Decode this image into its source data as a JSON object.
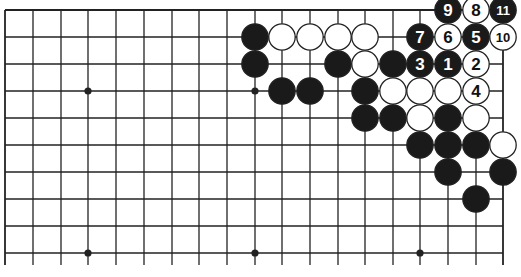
{
  "diagram": {
    "type": "go-board-partial",
    "colors": {
      "line": "#222222",
      "black_stone": "#1a1a1a",
      "white_stone": "#ffffff",
      "background": "#ffffff"
    },
    "grid": {
      "columns": 19,
      "visible_rows": 10,
      "col_x": [
        5,
        33,
        61,
        88,
        116,
        144,
        172,
        199,
        227,
        255,
        282,
        310,
        338,
        365,
        393,
        420,
        448,
        476,
        503
      ],
      "row_y": [
        10,
        37,
        64,
        91,
        118,
        145,
        172,
        199,
        226,
        253
      ],
      "bottom_extent": 265,
      "edges": [
        "top",
        "left",
        "right"
      ]
    },
    "hoshi": [
      {
        "col": 3,
        "row": 3
      },
      {
        "col": 9,
        "row": 3
      },
      {
        "col": 15,
        "row": 3
      },
      {
        "col": 3,
        "row": 9
      },
      {
        "col": 9,
        "row": 9
      },
      {
        "col": 15,
        "row": 9
      }
    ],
    "stones": [
      {
        "col": 16,
        "row": 0,
        "color": "black",
        "label": "9"
      },
      {
        "col": 17,
        "row": 0,
        "color": "white",
        "label": "8"
      },
      {
        "col": 18,
        "row": 0,
        "color": "black",
        "label": "11"
      },
      {
        "col": 9,
        "row": 1,
        "color": "black",
        "label": ""
      },
      {
        "col": 10,
        "row": 1,
        "color": "white",
        "label": ""
      },
      {
        "col": 11,
        "row": 1,
        "color": "white",
        "label": ""
      },
      {
        "col": 12,
        "row": 1,
        "color": "white",
        "label": ""
      },
      {
        "col": 13,
        "row": 1,
        "color": "white",
        "label": ""
      },
      {
        "col": 15,
        "row": 1,
        "color": "black",
        "label": "7"
      },
      {
        "col": 16,
        "row": 1,
        "color": "white",
        "label": "6"
      },
      {
        "col": 17,
        "row": 1,
        "color": "black",
        "label": "5"
      },
      {
        "col": 18,
        "row": 1,
        "color": "white",
        "label": "10"
      },
      {
        "col": 9,
        "row": 2,
        "color": "black",
        "label": ""
      },
      {
        "col": 12,
        "row": 2,
        "color": "black",
        "label": ""
      },
      {
        "col": 13,
        "row": 2,
        "color": "white",
        "label": ""
      },
      {
        "col": 14,
        "row": 2,
        "color": "black",
        "label": ""
      },
      {
        "col": 15,
        "row": 2,
        "color": "black",
        "label": "3"
      },
      {
        "col": 16,
        "row": 2,
        "color": "black",
        "label": "1"
      },
      {
        "col": 17,
        "row": 2,
        "color": "white",
        "label": "2"
      },
      {
        "col": 10,
        "row": 3,
        "color": "black",
        "label": ""
      },
      {
        "col": 11,
        "row": 3,
        "color": "black",
        "label": ""
      },
      {
        "col": 13,
        "row": 3,
        "color": "black",
        "label": ""
      },
      {
        "col": 14,
        "row": 3,
        "color": "white",
        "label": ""
      },
      {
        "col": 15,
        "row": 3,
        "color": "white",
        "label": ""
      },
      {
        "col": 16,
        "row": 3,
        "color": "white",
        "label": ""
      },
      {
        "col": 17,
        "row": 3,
        "color": "white",
        "label": "4"
      },
      {
        "col": 13,
        "row": 4,
        "color": "black",
        "label": ""
      },
      {
        "col": 14,
        "row": 4,
        "color": "black",
        "label": ""
      },
      {
        "col": 15,
        "row": 4,
        "color": "white",
        "label": ""
      },
      {
        "col": 16,
        "row": 4,
        "color": "black",
        "label": ""
      },
      {
        "col": 17,
        "row": 4,
        "color": "white",
        "label": ""
      },
      {
        "col": 15,
        "row": 5,
        "color": "black",
        "label": ""
      },
      {
        "col": 16,
        "row": 5,
        "color": "black",
        "label": ""
      },
      {
        "col": 17,
        "row": 5,
        "color": "black",
        "label": ""
      },
      {
        "col": 18,
        "row": 5,
        "color": "white",
        "label": ""
      },
      {
        "col": 16,
        "row": 6,
        "color": "black",
        "label": ""
      },
      {
        "col": 18,
        "row": 6,
        "color": "black",
        "label": ""
      },
      {
        "col": 17,
        "row": 7,
        "color": "black",
        "label": ""
      }
    ]
  }
}
